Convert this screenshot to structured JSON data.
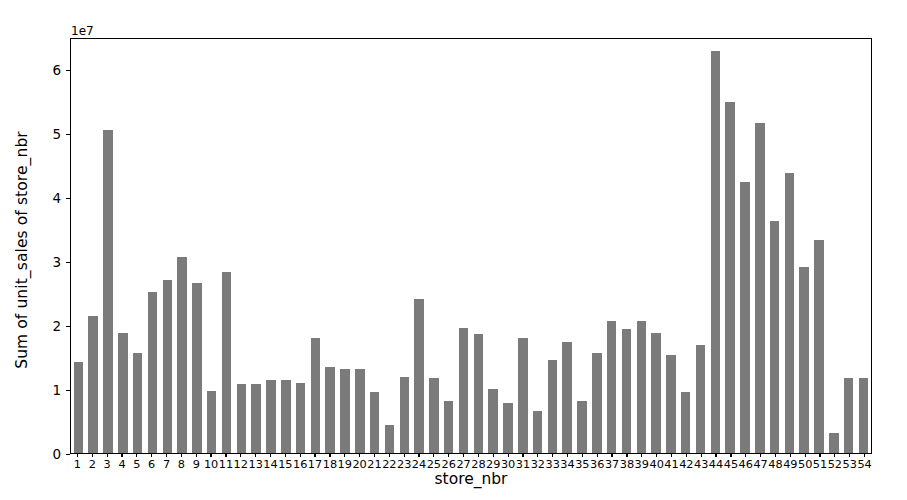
{
  "chart_data": {
    "type": "bar",
    "title": "",
    "xlabel": "store_nbr",
    "ylabel": "Sum of unit_sales of store_nbr",
    "y_offset_text": "1e7",
    "y_offset_multiplier": 10000000,
    "ylim": [
      0,
      6.5
    ],
    "xlim": [
      0.5,
      54.5
    ],
    "grid": false,
    "legend": null,
    "bar_color": "#7b7b7b",
    "axis_color": "#000000",
    "background_color": "#ffffff",
    "ytick_labels": [
      "0",
      "1",
      "2",
      "3",
      "4",
      "5",
      "6"
    ],
    "ytick_values": [
      0,
      1,
      2,
      3,
      4,
      5,
      6
    ],
    "categories": [
      "1",
      "2",
      "3",
      "4",
      "5",
      "6",
      "7",
      "8",
      "9",
      "10",
      "11",
      "12",
      "13",
      "14",
      "15",
      "16",
      "17",
      "18",
      "19",
      "20",
      "21",
      "22",
      "23",
      "24",
      "25",
      "26",
      "27",
      "28",
      "29",
      "30",
      "31",
      "32",
      "33",
      "34",
      "35",
      "36",
      "37",
      "38",
      "39",
      "40",
      "41",
      "42",
      "43",
      "44",
      "45",
      "46",
      "47",
      "48",
      "49",
      "50",
      "51",
      "52",
      "53",
      "54"
    ],
    "values": [
      1.42,
      2.14,
      5.04,
      1.88,
      1.57,
      2.52,
      2.7,
      3.06,
      2.65,
      0.97,
      2.83,
      1.08,
      1.08,
      1.14,
      1.14,
      1.1,
      1.8,
      1.34,
      1.32,
      1.31,
      0.95,
      0.43,
      1.19,
      2.4,
      1.17,
      0.81,
      1.95,
      1.86,
      1.0,
      0.78,
      1.8,
      0.65,
      1.45,
      1.74,
      0.81,
      1.57,
      2.06,
      1.93,
      2.07,
      1.88,
      1.53,
      0.95,
      1.68,
      6.28,
      5.49,
      4.24,
      5.16,
      3.62,
      4.38,
      2.91,
      3.33,
      0.32,
      1.17,
      1.17
    ],
    "value_units": "1e7"
  }
}
